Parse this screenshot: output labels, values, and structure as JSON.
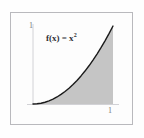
{
  "figure": {
    "title": "",
    "formula_base": "f(x) = x",
    "formula_exponent": "2",
    "formula_full": "f(x) = x²",
    "frame_color": "#b9b9bd",
    "curve_color": "#1a1a1a",
    "shade_color": "#b5b5b5",
    "axis_color": "#d2d2d6",
    "background_color": "#fdfdfd"
  },
  "axes": {
    "x_tick_label": "1",
    "y_tick_label": "1",
    "x_label": "",
    "y_label": ""
  },
  "chart_data": {
    "type": "area",
    "subtitle": "",
    "xlabel": "",
    "ylabel": "",
    "xlim": [
      0,
      1
    ],
    "ylim": [
      0,
      1
    ],
    "xticks": [
      1
    ],
    "xticklabels": [
      "1"
    ],
    "yticks": [
      1
    ],
    "yticklabels": [
      "1"
    ],
    "grid": false,
    "legend": false,
    "annotations": [
      {
        "text": "f(x) = x²",
        "x": 0.35,
        "y": 0.72
      }
    ],
    "series": [
      {
        "name": "f(x) = x²",
        "fill": true,
        "fill_to": 0,
        "x": [
          0.0,
          0.05,
          0.1,
          0.15,
          0.2,
          0.25,
          0.3,
          0.35,
          0.4,
          0.45,
          0.5,
          0.55,
          0.6,
          0.65,
          0.7,
          0.75,
          0.8,
          0.85,
          0.9,
          0.95,
          1.0
        ],
        "values": [
          0.0,
          0.0025,
          0.01,
          0.0225,
          0.04,
          0.0625,
          0.09,
          0.1225,
          0.16,
          0.2025,
          0.25,
          0.3025,
          0.36,
          0.4225,
          0.49,
          0.5625,
          0.64,
          0.7225,
          0.81,
          0.9025,
          1.0
        ]
      }
    ]
  }
}
